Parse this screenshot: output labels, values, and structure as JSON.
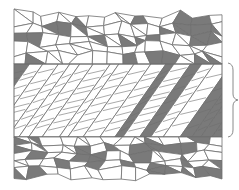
{
  "diagram": {
    "colors": {
      "background": "#ffffff",
      "grain_light": "#ffffff",
      "grain_dark": "#7a7a7a",
      "boundary": "#6e6e6e"
    },
    "regions": [
      {
        "name": "top-random-grains",
        "y_range": [
          12,
          64
        ]
      },
      {
        "name": "textured-band",
        "y_range": [
          64,
          137
        ]
      },
      {
        "name": "bottom-random-grains",
        "y_range": [
          137,
          178
        ]
      }
    ],
    "annotation": {
      "type": "curly-brace",
      "side": "right",
      "spans": "textured-band"
    }
  }
}
